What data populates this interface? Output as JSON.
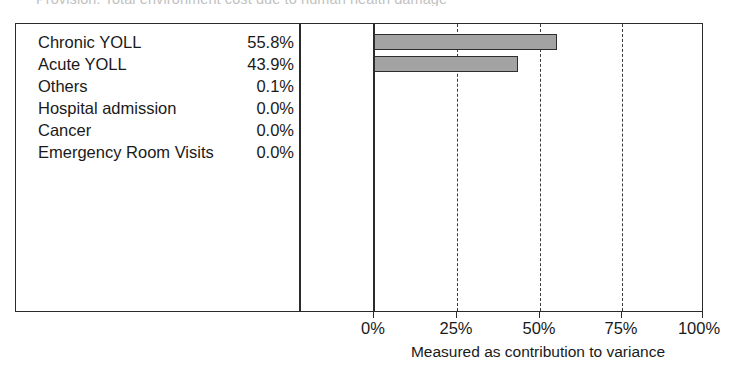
{
  "document": {
    "clipped_title": "Provision: Total environment cost due to human health damage"
  },
  "axis": {
    "caption": "Measured as contribution to variance",
    "ticks": [
      {
        "label": "0%",
        "value": 0
      },
      {
        "label": "25%",
        "value": 25
      },
      {
        "label": "50%",
        "value": 50
      },
      {
        "label": "75%",
        "value": 75
      },
      {
        "label": "100%",
        "value": 100
      }
    ]
  },
  "colors": {
    "bar_fill": "#a3a3a3",
    "bar_border": "#2e2e2e",
    "frame": "#2b2b2b"
  },
  "rows": [
    {
      "label": "Chronic YOLL",
      "value_text": "55.8%",
      "value": 55.8
    },
    {
      "label": "Acute YOLL",
      "value_text": "43.9%",
      "value": 43.9
    },
    {
      "label": "Others",
      "value_text": "0.1%",
      "value": 0.1
    },
    {
      "label": "Hospital admission",
      "value_text": "0.0%",
      "value": 0.0
    },
    {
      "label": "Cancer",
      "value_text": "0.0%",
      "value": 0.0
    },
    {
      "label": "Emergency Room Visits",
      "value_text": "0.0%",
      "value": 0.0
    }
  ],
  "chart_data": {
    "type": "bar",
    "orientation": "horizontal",
    "title": "Provision: Total environment cost due to human health damage",
    "categories": [
      "Chronic YOLL",
      "Acute YOLL",
      "Others",
      "Hospital admission",
      "Cancer",
      "Emergency Room Visits"
    ],
    "values": [
      55.8,
      43.9,
      0.1,
      0.0,
      0.0,
      0.0
    ],
    "value_labels": [
      "55.8%",
      "43.9%",
      "0.1%",
      "0.0%",
      "0.0%",
      "0.0%"
    ],
    "xlabel": "Measured as contribution to variance",
    "ylabel": "",
    "xlim": [
      0,
      100
    ],
    "xticks": [
      0,
      25,
      50,
      75,
      100
    ],
    "xtick_labels": [
      "0%",
      "25%",
      "50%",
      "75%",
      "100%"
    ],
    "grid": "vertical-dashed",
    "legend": "none",
    "units": "percent"
  }
}
